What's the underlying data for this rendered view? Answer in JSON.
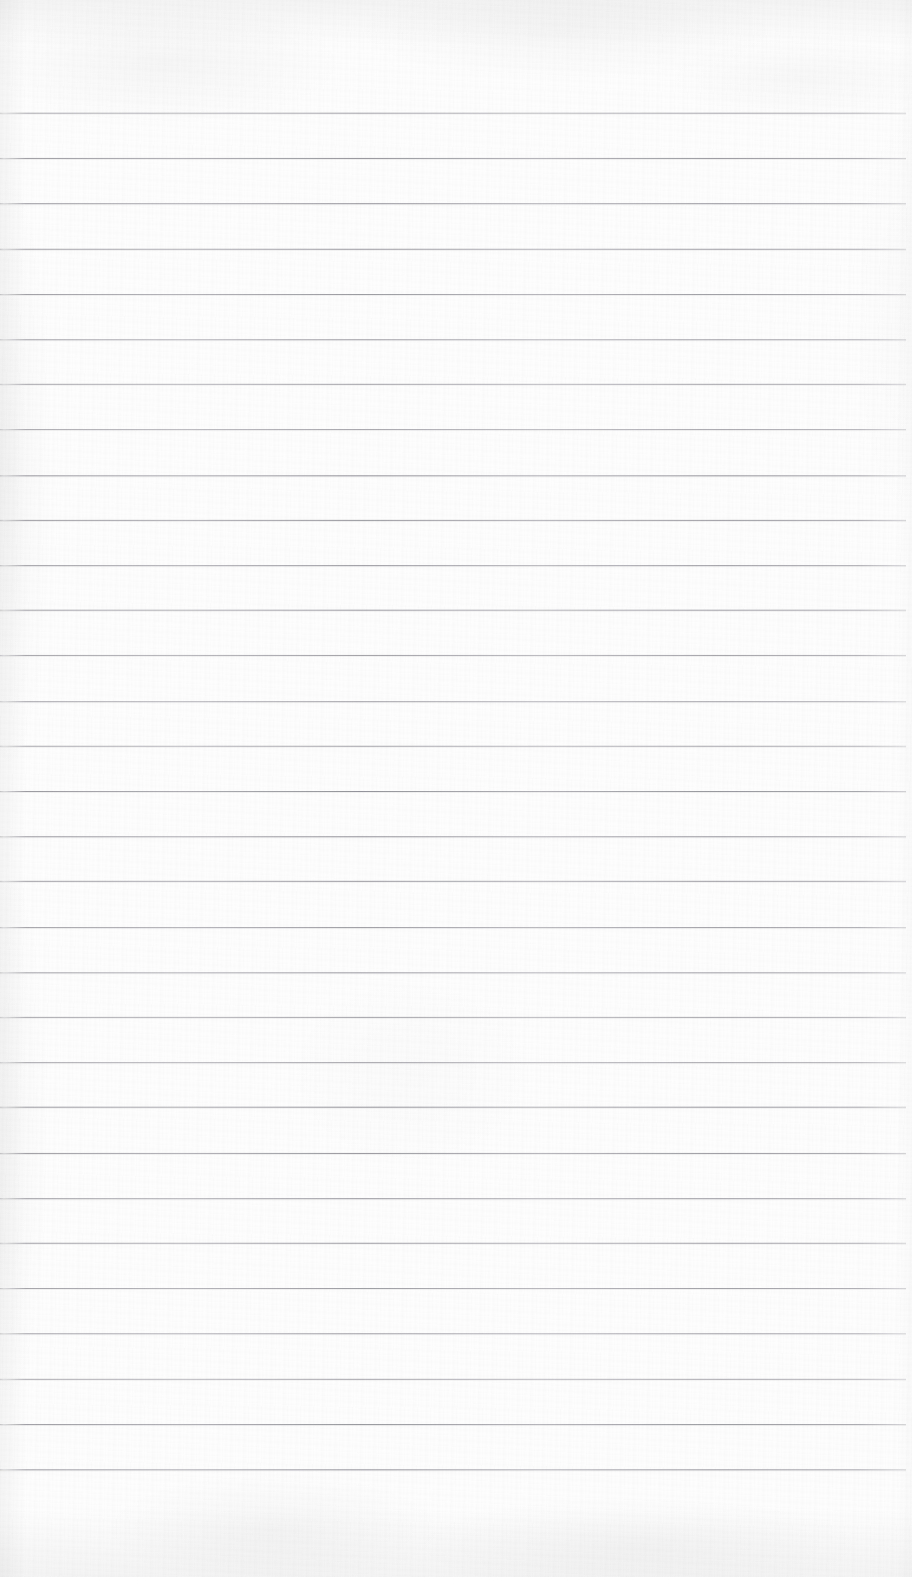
{
  "document": {
    "kind": "ruled-paper-scan",
    "title": "Blank ruled notebook page",
    "description": "Scanned blank lined paper, no handwriting or printed text",
    "width_px": 912,
    "height_px": 1577,
    "has_text": false,
    "has_margin_rule": false,
    "visible_text": ""
  },
  "paper": {
    "background_color": "#fdfdfd",
    "edge_shade_color": "#ededef",
    "texture": "faint paper grain with soft edge vignette"
  },
  "rules": {
    "count": 31,
    "color": "#9496a0",
    "thickness_px": 1,
    "first_line_y": 113,
    "spacing_px": 45.2,
    "left_x": 0,
    "right_x": 906,
    "y_positions": [
      113,
      158,
      203,
      249,
      294,
      339,
      384,
      429,
      475,
      520,
      565,
      610,
      655,
      701,
      746,
      791,
      836,
      881,
      927,
      972,
      1017,
      1062,
      1107,
      1153,
      1198,
      1243,
      1288,
      1333,
      1379,
      1424,
      1469
    ]
  }
}
